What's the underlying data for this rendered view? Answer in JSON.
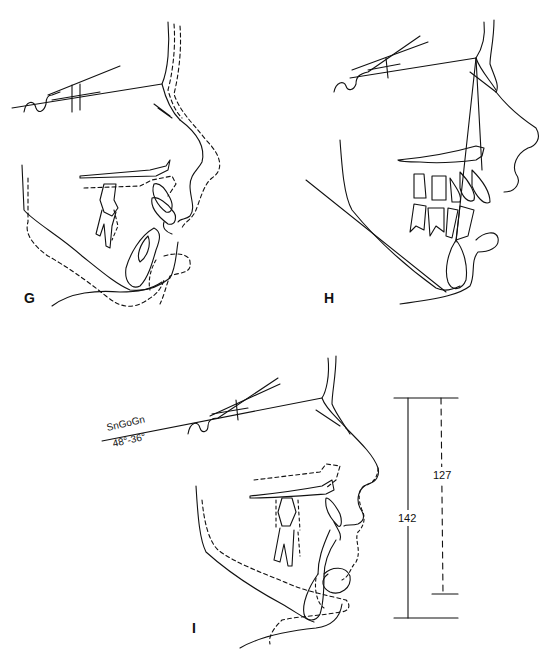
{
  "figure": {
    "line_color": "#111111",
    "background": "#ffffff",
    "panels": [
      {
        "id": "G",
        "letter": "G",
        "style": "solid and dashed superimposed tracing (before/after)"
      },
      {
        "id": "H",
        "letter": "H",
        "style": "solid tracing with mandibular plane and facial lines"
      },
      {
        "id": "I",
        "letter": "I",
        "style": "solid and dashed superimposed tracing with face height measurements"
      }
    ],
    "annotations": {
      "plane_name": "SnGoGn",
      "plane_angles": "48°-36°",
      "total_height_solid": "142",
      "total_height_dashed": "127"
    }
  }
}
